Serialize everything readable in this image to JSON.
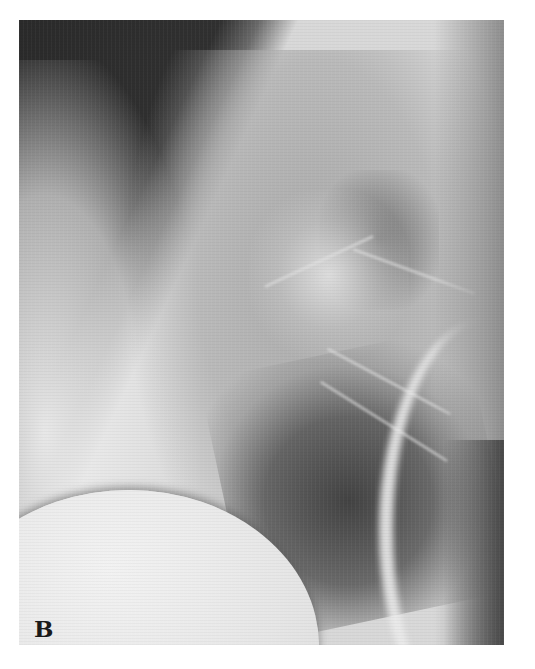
{
  "figure": {
    "panel_label": "B",
    "colors": {
      "background": "#ffffff",
      "dark_air": "#2a2a2a",
      "lung_field": "#a5a5a5",
      "bright_bone_soft_tissue": "#f0f0f0",
      "label": "#1a1a1a"
    }
  }
}
